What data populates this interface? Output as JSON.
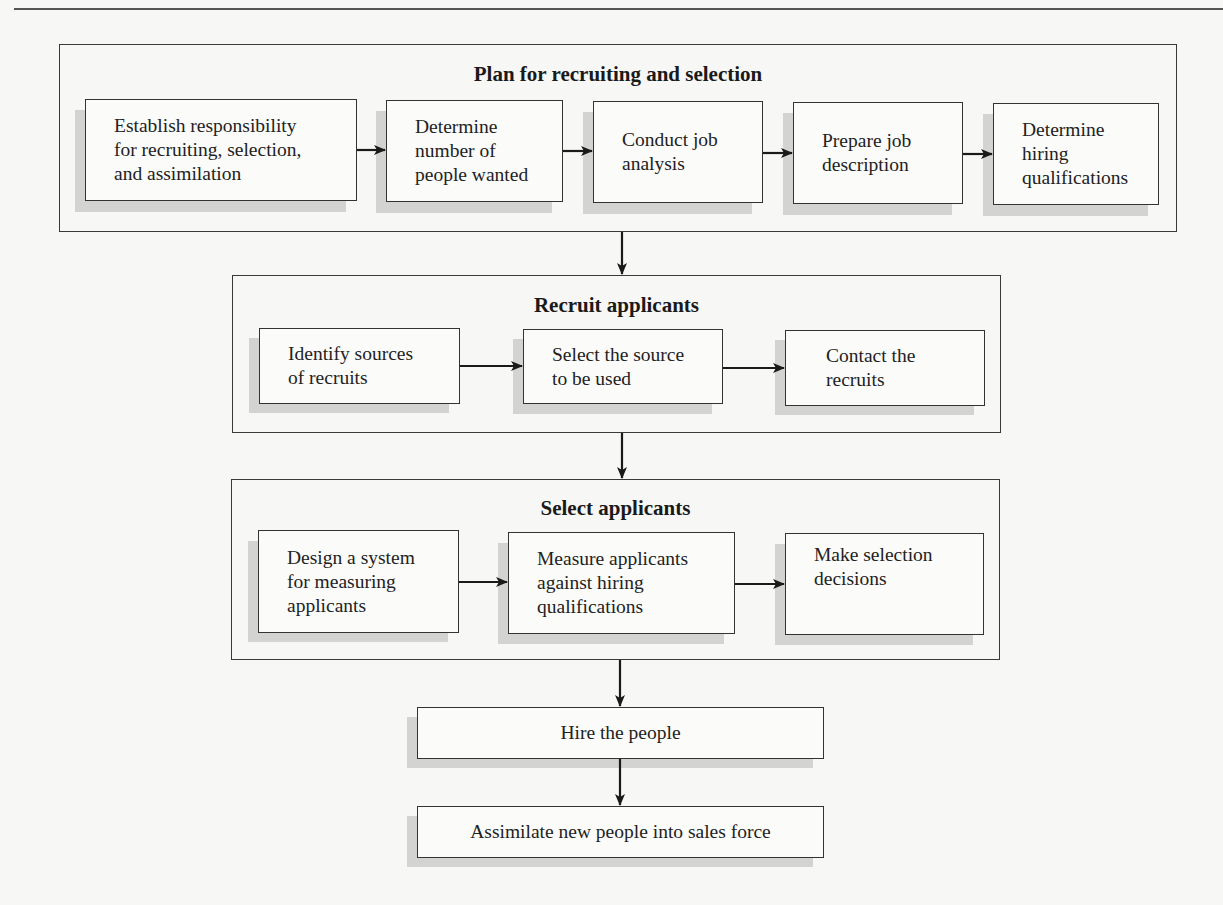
{
  "diagram": {
    "groups": [
      {
        "title": "Plan for recruiting and selection",
        "steps": [
          "Establish responsibility for recruiting, selection, and assimilation",
          "Determine number of people wanted",
          "Conduct job analysis",
          "Prepare job description",
          "Determine hiring qualifications"
        ],
        "step_lines": [
          [
            "Establish responsibility",
            "for recruiting, selection,",
            "and assimilation"
          ],
          [
            "Determine",
            "number of",
            "people wanted"
          ],
          [
            "Conduct job",
            "analysis"
          ],
          [
            "Prepare job",
            "description"
          ],
          [
            "Determine",
            "hiring",
            "qualifications"
          ]
        ]
      },
      {
        "title": "Recruit applicants",
        "steps": [
          "Identify sources of recruits",
          "Select the source to be used",
          "Contact the recruits"
        ],
        "step_lines": [
          [
            "Identify sources",
            "of recruits"
          ],
          [
            "Select the source",
            "to be used"
          ],
          [
            "Contact the",
            "recruits"
          ]
        ]
      },
      {
        "title": "Select applicants",
        "steps": [
          "Design a system for measuring applicants",
          "Measure applicants against hiring qualifications",
          "Make selection decisions"
        ],
        "step_lines": [
          [
            "Design a system",
            "for measuring",
            "applicants"
          ],
          [
            "Measure applicants",
            "against hiring",
            "qualifications"
          ],
          [
            "Make selection",
            "decisions",
            ""
          ]
        ]
      }
    ],
    "final_steps": [
      "Hire the people",
      "Assimilate new people into sales force"
    ],
    "colors": {
      "line": "#333333",
      "shadow": "#d3d3d1",
      "box_fill": "#fbfbfa",
      "page": "#f7f7f5"
    }
  }
}
